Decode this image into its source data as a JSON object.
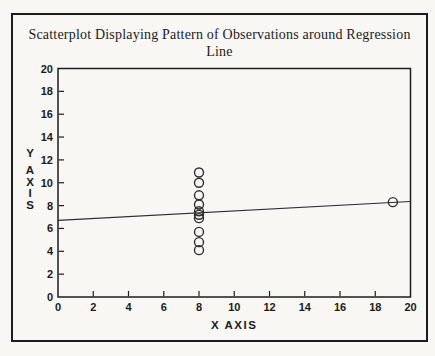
{
  "page": {
    "background": "#f8f7f4",
    "ink": "#1d1d1d",
    "plot_stroke": "#2e2e2e"
  },
  "title": {
    "line1": "Scatterplot Displaying Pattern of Observations around Regression",
    "line2": "Line"
  },
  "chart_data": {
    "type": "scatter",
    "title": "Scatterplot Displaying Pattern of Observations around Regression Line",
    "xlabel": "X AXIS",
    "ylabel": "Y AXIS",
    "xlim": [
      0,
      20
    ],
    "ylim": [
      0,
      20
    ],
    "xticks": [
      0,
      2,
      4,
      6,
      8,
      10,
      12,
      14,
      16,
      18,
      20
    ],
    "yticks": [
      0,
      2,
      4,
      6,
      8,
      10,
      12,
      14,
      16,
      18,
      20
    ],
    "grid": false,
    "legend": "none",
    "series": [
      {
        "name": "observations",
        "marker": "open-circle",
        "points": [
          [
            8,
            10.9
          ],
          [
            8,
            10.0
          ],
          [
            8,
            8.9
          ],
          [
            8,
            8.1
          ],
          [
            8,
            7.5
          ],
          [
            8,
            7.2
          ],
          [
            8,
            6.9
          ],
          [
            8,
            5.7
          ],
          [
            8,
            4.8
          ],
          [
            8,
            4.1
          ],
          [
            19,
            8.3
          ]
        ]
      }
    ],
    "regression_line": {
      "x": [
        0,
        20
      ],
      "y": [
        6.7,
        8.36
      ],
      "intercept": 6.7,
      "slope": 0.083
    }
  }
}
